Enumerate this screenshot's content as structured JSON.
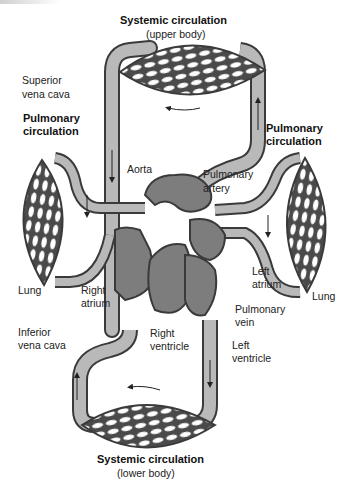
{
  "colors": {
    "vessel_fill": "#b9b9b9",
    "vessel_stroke": "#3a3a3a",
    "heart_dark": "#7d7d7d",
    "capillary_bg": "#5a5a5a",
    "background": "#ffffff"
  },
  "labels": {
    "systemic_upper_title": "Systemic circulation",
    "systemic_upper_sub": "(upper body)",
    "superior_vena_cava_1": "Superior",
    "superior_vena_cava_2": "vena cava",
    "pulmonary_left_1": "Pulmonary",
    "pulmonary_left_2": "circulation",
    "pulmonary_right_1": "Pulmonary",
    "pulmonary_right_2": "circulation",
    "aorta": "Aorta",
    "pulmonary_artery_1": "Pulmonary",
    "pulmonary_artery_2": "artery",
    "lung_left": "Lung",
    "lung_right": "Lung",
    "right_atrium_1": "Right",
    "right_atrium_2": "atrium",
    "left_atrium_1": "Left",
    "left_atrium_2": "atrium",
    "pulmonary_vein_1": "Pulmonary",
    "pulmonary_vein_2": "vein",
    "inferior_vena_cava_1": "Inferior",
    "inferior_vena_cava_2": "vena cava",
    "right_ventricle_1": "Right",
    "right_ventricle_2": "ventricle",
    "left_ventricle_1": "Left",
    "left_ventricle_2": "ventricle",
    "systemic_lower_title": "Systemic circulation",
    "systemic_lower_sub": "(lower body)"
  }
}
